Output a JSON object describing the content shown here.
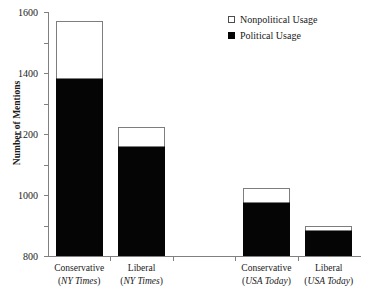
{
  "chart_data": {
    "type": "bar",
    "title": "",
    "subtitle": "",
    "xlabel": "",
    "ylabel": "Number of Mentions",
    "stacked": true,
    "grid": false,
    "legend_position": "top-right",
    "ylim": [
      0,
      1600
    ],
    "ytick_step": 200,
    "ytick_labels": [
      "1600",
      "1400",
      "1200",
      "1000",
      "800",
      "600",
      "400",
      "200",
      "0"
    ],
    "ytick_values": [
      1600,
      1400,
      1200,
      1000,
      800,
      600,
      400,
      200,
      0
    ],
    "categories": [
      "Conservative (NY Times)",
      "Liberal (NY Times)",
      "Conservative (USA Today)",
      "Liberal (USA Today)"
    ],
    "category_labels": [
      {
        "line1": "Conservative",
        "line2": "(NY Times)"
      },
      {
        "line1": "Liberal",
        "line2": "(NY Times)"
      },
      {
        "line1": "Conservative",
        "line2": "(USA Today)"
      },
      {
        "line1": "Liberal",
        "line2": "(USA Today)"
      }
    ],
    "series": [
      {
        "name": "Political Usage",
        "color": "#050505",
        "values": [
          1170,
          721,
          354,
          170
        ]
      },
      {
        "name": "Nonpolitical Usage",
        "color": "#ffffff",
        "values": [
          371,
          125,
          92,
          27
        ]
      }
    ],
    "totals": [
      1541,
      846,
      446,
      197
    ],
    "legend": [
      {
        "label": "Nonpolitical Usage",
        "swatch": "hollow",
        "color": "#ffffff"
      },
      {
        "label": "Political Usage",
        "swatch": "filled",
        "color": "#050505"
      }
    ],
    "axis_color": "#808080"
  }
}
